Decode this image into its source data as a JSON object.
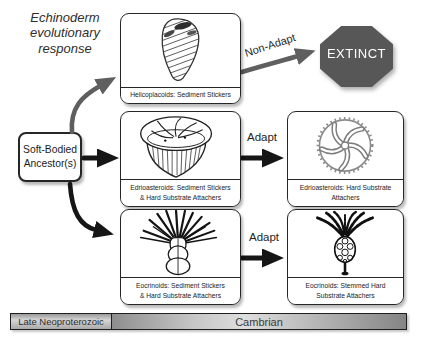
{
  "title": {
    "line1": "Echinoderm",
    "line2": "evolutionary",
    "line3": "response"
  },
  "ancestor": {
    "line1": "Soft-Bodied",
    "line2": "Ancestor(s)"
  },
  "arrows": {
    "non_adapt_label": "Non-Adapt",
    "adapt_upper_label": "Adapt",
    "adapt_lower_label": "Adapt"
  },
  "extinct": {
    "label": "EXTINCT",
    "fill_color": "#575757"
  },
  "panels": {
    "helicoplacoids": {
      "caption": "Helicoplacoids: Sediment Stickers",
      "icon": "helicoplacoid-spiral-fossil-icon"
    },
    "edrioasteroids_sediment": {
      "caption_line1": "Edrioasteroids: Sediment Stickers",
      "caption_line2": "& Hard Substrate Attachers",
      "icon": "edrioasteroid-dome-fossil-icon"
    },
    "eocrinoids_sediment": {
      "caption_line1": "Eocrinoids: Sediment Stickers",
      "caption_line2": "& Hard Substrate Attachers",
      "icon": "eocrinoid-spiny-fossil-icon"
    },
    "edrioasteroids_hard": {
      "caption_line1": "Edrioasteroids: Hard Substrate",
      "caption_line2": "Attachers",
      "icon": "edrioasteroid-star-disc-fossil-icon"
    },
    "eocrinoids_stemmed": {
      "caption_line1": "Eocrinoids: Stemmed Hard",
      "caption_line2": "Substrate Attachers",
      "icon": "eocrinoid-stemmed-fossil-icon"
    }
  },
  "timeline": {
    "left_label": "Late Neoproterozoic",
    "right_label": "Cambrian"
  },
  "colors": {
    "arrow_black": "#161616",
    "arrow_gray": "#5f5f5f",
    "extinct_fill": "#575757",
    "line_art": "#222222"
  }
}
